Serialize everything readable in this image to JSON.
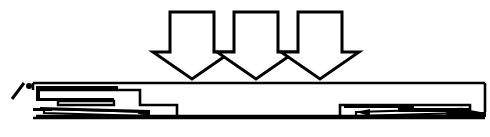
{
  "figure": {
    "domain": "line-diagram",
    "width": 490,
    "height": 137,
    "background_color": "#ffffff",
    "ink_color": "#000000",
    "visible_text": "",
    "labels": [],
    "annotations": []
  },
  "arrows": {
    "count": 3,
    "direction": "down",
    "style": "hollow-outline-block-arrow",
    "stroke_width": 3,
    "fill": "#ffffff",
    "stroke": "#000000",
    "shaft_top_y": 12,
    "shaft_bottom_y": 52,
    "head_top_y": 52,
    "tip_y": 79,
    "items": [
      {
        "name": "load-arrow-1",
        "shaft_left_x": 170,
        "shaft_right_x": 214,
        "head_left_x": 153,
        "head_right_x": 231,
        "tip_x": 192
      },
      {
        "name": "load-arrow-2",
        "shaft_left_x": 234,
        "shaft_right_x": 278,
        "head_left_x": 217,
        "head_right_x": 295,
        "tip_x": 256
      },
      {
        "name": "load-arrow-3",
        "shaft_left_x": 298,
        "shaft_right_x": 342,
        "head_left_x": 281,
        "head_right_x": 359,
        "tip_x": 320
      }
    ]
  },
  "beam": {
    "name": "stepped-beam",
    "top_y": 82,
    "left_x": 33,
    "right_x": 485,
    "stroke_width": 2,
    "upper_web_bottom_y": 101,
    "step_x": 140,
    "step_lower_y": 104,
    "baseline_y": 118,
    "baseline_left_x": 33,
    "baseline_right_x": 485
  },
  "left_support": {
    "name": "left-layered-support",
    "x_start": 33,
    "x_end": 150,
    "plates": [
      {
        "name": "left-plate-upper",
        "x1": 36,
        "x2": 110,
        "y": 92,
        "thickness": 3
      },
      {
        "name": "left-plate-middle",
        "x1": 40,
        "x2": 105,
        "y": 100,
        "thickness": 4
      },
      {
        "name": "left-plate-lower",
        "x1": 36,
        "x2": 148,
        "y": 110,
        "thickness": 3
      }
    ]
  },
  "right_support": {
    "name": "right-layered-support",
    "x_start": 340,
    "x_end": 487,
    "plates": [
      {
        "name": "right-plate-upper",
        "x1": 344,
        "x2": 414,
        "y": 104,
        "thickness": 3
      },
      {
        "name": "right-plate-middle",
        "x1": 372,
        "x2": 470,
        "y": 110,
        "thickness": 4
      },
      {
        "name": "right-plate-lower",
        "x1": 348,
        "x2": 486,
        "y": 114,
        "thickness": 3
      }
    ]
  },
  "left_marker": {
    "name": "left-hatch-marker",
    "description": "Small diagonal tick and filled dot at the far left end indicating the support reference",
    "slash_x1": 12,
    "slash_y1": 99,
    "slash_x2": 24,
    "slash_y2": 83,
    "dot_cx": 29,
    "dot_cy": 86,
    "dot_r": 3
  }
}
